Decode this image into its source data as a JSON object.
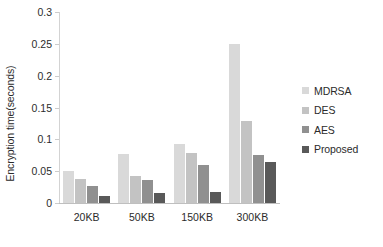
{
  "chart_data": {
    "type": "bar",
    "title": "",
    "xlabel": "",
    "ylabel": "Encryption time(seconds)",
    "categories": [
      "20KB",
      "50KB",
      "150KB",
      "300KB"
    ],
    "series": [
      {
        "name": "MDRSA",
        "values": [
          0.05,
          0.077,
          0.093,
          0.25
        ],
        "color": "#d9d9d9"
      },
      {
        "name": "DES",
        "values": [
          0.038,
          0.042,
          0.079,
          0.129
        ],
        "color": "#c3c3c3"
      },
      {
        "name": "AES",
        "values": [
          0.026,
          0.036,
          0.06,
          0.076
        ],
        "color": "#909090"
      },
      {
        "name": "Proposed",
        "values": [
          0.011,
          0.015,
          0.018,
          0.065
        ],
        "color": "#595959"
      }
    ],
    "ylim": [
      0,
      0.3
    ],
    "ytick_labels": [
      "0.3",
      "0.25",
      "0.2",
      "0.15",
      "0.1",
      "0.05",
      "0"
    ],
    "ytick_values": [
      0.3,
      0.25,
      0.2,
      0.15,
      0.1,
      0.05,
      0
    ],
    "grid": false,
    "legend_position": "right"
  },
  "legend": {
    "items": [
      {
        "label": "MDRSA"
      },
      {
        "label": "DES"
      },
      {
        "label": "AES"
      },
      {
        "label": "Proposed"
      }
    ]
  }
}
